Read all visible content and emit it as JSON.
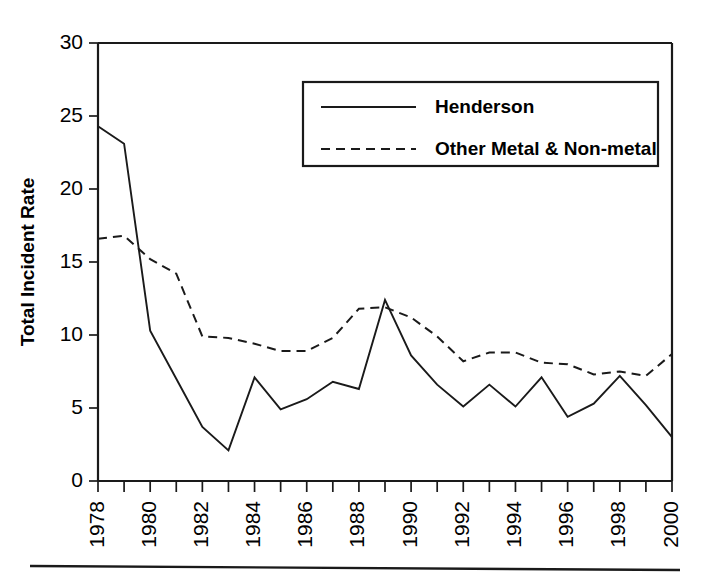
{
  "chart_data": {
    "type": "line",
    "title": "",
    "subtitle": "",
    "xlabel": "",
    "ylabel": "Total Incident Rate",
    "x": [
      1978,
      1979,
      1980,
      1981,
      1982,
      1983,
      1984,
      1985,
      1986,
      1987,
      1988,
      1989,
      1990,
      1991,
      1992,
      1993,
      1994,
      1995,
      1996,
      1997,
      1998,
      1999,
      2000
    ],
    "xlim": [
      1978,
      2000
    ],
    "ylim": [
      0,
      30
    ],
    "y_ticks": [
      0,
      5,
      10,
      15,
      20,
      25,
      30
    ],
    "x_tick_labels": [
      "1978",
      "1980",
      "1982",
      "1984",
      "1986",
      "1988",
      "1990",
      "1992",
      "1994",
      "1996",
      "1998",
      "2000"
    ],
    "x_tick_values": [
      1978,
      1980,
      1982,
      1984,
      1986,
      1988,
      1990,
      1992,
      1994,
      1996,
      1998,
      2000
    ],
    "x_minor_tick_values": [
      1979,
      1981,
      1983,
      1985,
      1987,
      1989,
      1991,
      1993,
      1995,
      1997,
      1999
    ],
    "grid": false,
    "legend_position": "top-right-inside",
    "series": [
      {
        "name": "Henderson",
        "style": "solid",
        "color": "#1a1a1a",
        "values": [
          24.3,
          23.1,
          10.3,
          7.0,
          3.7,
          2.1,
          7.1,
          4.9,
          5.6,
          6.8,
          6.3,
          12.4,
          8.6,
          6.6,
          5.1,
          6.6,
          5.1,
          7.1,
          4.4,
          5.3,
          7.2,
          5.2,
          3.0
        ]
      },
      {
        "name": "Other Metal & Non-metal",
        "style": "dashed",
        "color": "#1a1a1a",
        "values": [
          16.6,
          16.8,
          15.2,
          14.2,
          9.9,
          9.8,
          9.4,
          8.9,
          8.9,
          9.8,
          11.8,
          11.9,
          11.2,
          9.9,
          8.2,
          8.8,
          8.8,
          8.1,
          8.0,
          7.3,
          7.5,
          7.2,
          8.7
        ]
      }
    ]
  },
  "legend": {
    "items": [
      {
        "label": "Henderson",
        "style": "solid"
      },
      {
        "label": "Other Metal & Non-metal",
        "style": "dashed"
      }
    ]
  },
  "axes": {
    "y_label": "Total Incident Rate",
    "y_tick_labels": [
      "0",
      "5",
      "10",
      "15",
      "20",
      "25",
      "30"
    ]
  }
}
